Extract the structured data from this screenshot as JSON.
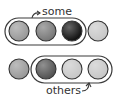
{
  "labels": {
    "top": "some",
    "bottom": "others"
  },
  "rows": [
    {
      "name": "top-row",
      "circles": [
        {
          "fill": "#9a9a9a"
        },
        {
          "fill": "#7a7a7a"
        },
        {
          "fill": "#141414"
        },
        {
          "fill": "#c8c8c8"
        }
      ],
      "grouped": [
        0,
        1,
        2
      ]
    },
    {
      "name": "bottom-row",
      "circles": [
        {
          "fill": "#9a9a9a"
        },
        {
          "fill": "#555555"
        },
        {
          "fill": "#c8c8c8"
        },
        {
          "fill": "#c8c8c8"
        }
      ],
      "grouped": [
        1,
        2,
        3
      ]
    }
  ],
  "colors": {
    "outline": "#3a3a3a",
    "text": "#333333"
  }
}
